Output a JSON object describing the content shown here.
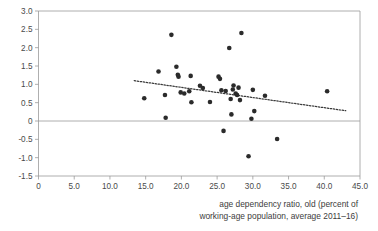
{
  "chart_data": {
    "type": "scatter",
    "title": "",
    "xlabel": "age dependency ratio, old (percent of working-age population, average 2011–16)",
    "ylabel": "",
    "xlim": [
      0,
      45
    ],
    "ylim": [
      -1.5,
      3.0
    ],
    "grid": false,
    "legend": null,
    "xticks": [
      0,
      5,
      10,
      15,
      20,
      25,
      30,
      35,
      40,
      45
    ],
    "xtick_labels": [
      "0",
      "5.0",
      "10.0",
      "15.0",
      "20.0",
      "25.0",
      "30.0",
      "35.0",
      "40.0",
      "45.0"
    ],
    "yticks": [
      -1.5,
      -1.0,
      -0.5,
      0,
      0.5,
      1.0,
      1.5,
      2.0,
      2.5,
      3.0
    ],
    "ytick_labels": [
      "-1.5",
      "-1.0",
      "-0.5",
      "0",
      "0.5",
      "1.0",
      "1.5",
      "2.0",
      "2.5",
      "3.0"
    ],
    "zero_line": 0,
    "marker_color": "#2b2b2b",
    "marker_size": 4.6,
    "points": [
      [
        14.8,
        0.62
      ],
      [
        16.8,
        1.35
      ],
      [
        17.7,
        0.71
      ],
      [
        17.8,
        0.09
      ],
      [
        18.6,
        2.35
      ],
      [
        19.3,
        1.48
      ],
      [
        19.5,
        1.26
      ],
      [
        19.6,
        1.21
      ],
      [
        19.9,
        0.78
      ],
      [
        20.4,
        0.75
      ],
      [
        21.1,
        0.81
      ],
      [
        21.3,
        1.23
      ],
      [
        21.4,
        0.51
      ],
      [
        22.6,
        0.96
      ],
      [
        23.0,
        0.9
      ],
      [
        24.0,
        0.52
      ],
      [
        25.2,
        1.21
      ],
      [
        25.4,
        1.15
      ],
      [
        25.6,
        0.84
      ],
      [
        25.9,
        -0.27
      ],
      [
        26.2,
        0.82
      ],
      [
        26.7,
        1.99
      ],
      [
        26.9,
        0.6
      ],
      [
        27.0,
        0.18
      ],
      [
        27.2,
        0.86
      ],
      [
        27.3,
        0.97
      ],
      [
        27.6,
        0.75
      ],
      [
        27.8,
        0.71
      ],
      [
        28.0,
        0.91
      ],
      [
        28.2,
        0.57
      ],
      [
        28.4,
        2.4
      ],
      [
        29.4,
        -0.96
      ],
      [
        29.8,
        0.06
      ],
      [
        30.0,
        0.85
      ],
      [
        30.2,
        0.27
      ],
      [
        31.7,
        0.69
      ],
      [
        33.4,
        -0.49
      ],
      [
        40.4,
        0.81
      ]
    ],
    "trend_line": {
      "style": "dotted",
      "x_start": 13.4,
      "y_start": 1.1,
      "x_end": 43.0,
      "y_end": 0.28
    }
  },
  "axis_caption": {
    "line1": "age dependency ratio, old (percent of",
    "line2": "working-age population, average 2011–16)"
  },
  "colors": {
    "marker": "#2b2b2b",
    "axis": "#9a9a9a",
    "text": "#3c3c3c",
    "background": "#ffffff"
  }
}
